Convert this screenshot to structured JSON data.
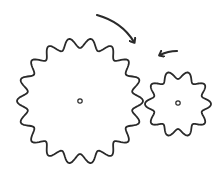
{
  "diagram": {
    "title": "",
    "colors": {
      "stroke": "#2a2a2a",
      "background": "#ffffff"
    },
    "gears": [
      {
        "id": "large",
        "cx": 80,
        "cy": 101,
        "radius": 58,
        "tooth_amp": 5,
        "teeth": 18,
        "rotation": "clockwise"
      },
      {
        "id": "small",
        "cx": 178,
        "cy": 104,
        "radius": 29,
        "tooth_amp": 4,
        "teeth": 10,
        "rotation": "counterclockwise"
      }
    ],
    "arrows": [
      {
        "id": "large-gear-arrow",
        "direction": "clockwise"
      },
      {
        "id": "small-gear-arrow",
        "direction": "counterclockwise"
      }
    ]
  }
}
